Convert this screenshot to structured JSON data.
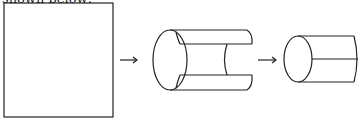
{
  "caption": "shown below:",
  "figure": {
    "stages": [
      {
        "name": "flat-sheet",
        "shape": "square"
      },
      {
        "name": "partially-rolled",
        "shape": "open-cylinder"
      },
      {
        "name": "rolled-cylinder",
        "shape": "cylinder"
      }
    ],
    "arrows": [
      "right-arrow",
      "right-arrow"
    ],
    "stroke_color": "#222222"
  }
}
